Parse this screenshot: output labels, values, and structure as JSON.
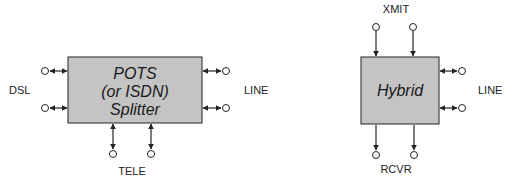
{
  "colors": {
    "box_fill": "#c4c4c4",
    "stroke": "#222222",
    "background": "#ffffff"
  },
  "splitter": {
    "title_lines": [
      "POTS",
      "(or ISDN)",
      "Splitter"
    ],
    "left_label": "DSL",
    "right_label": "LINE",
    "bottom_label": "TELE",
    "left_ports": 2,
    "right_ports": 2,
    "bottom_ports": 2
  },
  "hybrid": {
    "title": "Hybrid",
    "top_label": "XMIT",
    "right_label": "LINE",
    "bottom_label": "RCVR",
    "top_ports": 2,
    "right_ports": 2,
    "bottom_ports": 2
  }
}
